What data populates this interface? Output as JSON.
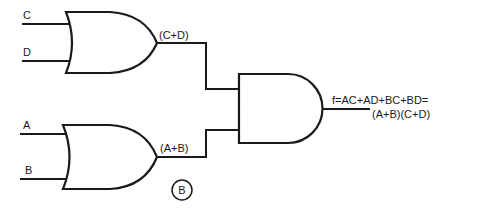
{
  "diagram": {
    "type": "logic-circuit",
    "inputs": {
      "c": "C",
      "d": "D",
      "a": "A",
      "b": "B"
    },
    "gates": [
      {
        "id": "or_top",
        "type": "OR",
        "inputs": [
          "C",
          "D"
        ],
        "output_label": "(C+D)"
      },
      {
        "id": "or_bottom",
        "type": "OR",
        "inputs": [
          "A",
          "B"
        ],
        "output_label": "(A+B)"
      },
      {
        "id": "and_final",
        "type": "AND",
        "inputs": [
          "(C+D)",
          "(A+B)"
        ]
      }
    ],
    "output": {
      "line1": "f=AC+AD+BC+BD=",
      "line2": "(A+B)(C+D)"
    },
    "figure_tag": "B"
  }
}
